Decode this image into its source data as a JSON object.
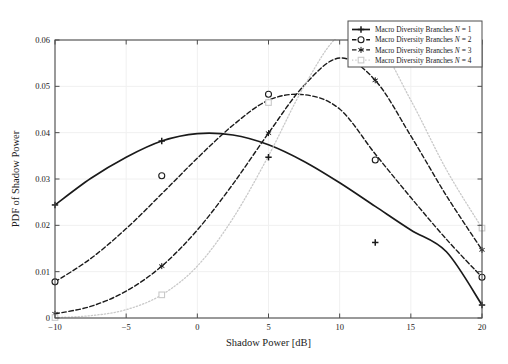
{
  "chart_data": {
    "type": "line",
    "title": "",
    "xlabel": "Shadow Power [dB]",
    "ylabel": "PDF of Shadow Power",
    "xlim": [
      -10,
      20
    ],
    "ylim": [
      0,
      0.06
    ],
    "xticks": [
      -10,
      -5,
      0,
      5,
      10,
      15,
      20
    ],
    "xtick_labels": [
      "−10",
      "−5",
      "0",
      "5",
      "10",
      "15",
      "20"
    ],
    "yticks": [
      0,
      0.01,
      0.02,
      0.03,
      0.04,
      0.05,
      0.06
    ],
    "ytick_labels": [
      "0",
      "0.01",
      "0.02",
      "0.03",
      "0.04",
      "0.05",
      "0.06"
    ],
    "grid": true,
    "legend_position": "top-right",
    "series": [
      {
        "name": "Macro Diversity Branches N = 1",
        "label_prefix": "Macro Diversity Branches ",
        "label_var": "N",
        "label_suffix": " = 1",
        "n": 1,
        "linestyle": "solid",
        "marker": "plus-filled",
        "color": "#1a1a1a",
        "width": 1.7,
        "mu": 0.6,
        "sigma": 10.0,
        "peak_x": 0.6,
        "peak_y": 0.0399,
        "x": [
          -10,
          -7.5,
          -5,
          -2.5,
          0,
          2.5,
          5,
          7.5,
          10,
          12.5,
          15,
          17.5,
          20
        ],
        "y": [
          0.0244,
          0.0301,
          0.0347,
          0.0382,
          0.0398,
          0.0395,
          0.0374,
          0.0338,
          0.0292,
          0.0241,
          0.019,
          0.0143,
          0.0028
        ],
        "markers_x": [
          -10,
          -2.5,
          5,
          12.5,
          20
        ],
        "markers_y": [
          0.0244,
          0.0382,
          0.0347,
          0.0163,
          0.0028
        ]
      },
      {
        "name": "Macro Diversity Branches N = 2",
        "label_prefix": "Macro Diversity Branches ",
        "label_var": "N",
        "label_suffix": " = 2",
        "n": 2,
        "linestyle": "dashed",
        "marker": "circle",
        "color": "#1a1a1a",
        "width": 1.4,
        "peak_x": 5.2,
        "peak_y": 0.0484,
        "x": [
          -10,
          -7.5,
          -5,
          -2.5,
          0,
          2.5,
          5,
          7.5,
          10,
          12.5,
          15,
          17.5,
          20
        ],
        "y": [
          0.0078,
          0.0128,
          0.0193,
          0.0268,
          0.0345,
          0.0416,
          0.047,
          0.0482,
          0.0451,
          0.0354,
          0.026,
          0.017,
          0.0088
        ],
        "markers_x": [
          -10,
          -2.5,
          5,
          12.5,
          20
        ],
        "markers_y": [
          0.0078,
          0.0307,
          0.0483,
          0.0341,
          0.0088
        ]
      },
      {
        "name": "Macro Diversity Branches N = 3",
        "label_prefix": "Macro Diversity Branches ",
        "label_var": "N",
        "label_suffix": " = 3",
        "n": 3,
        "linestyle": "dashed",
        "marker": "asterisk",
        "color": "#1a1a1a",
        "width": 1.4,
        "peak_x": 7.6,
        "peak_y": 0.0567,
        "x": [
          -10,
          -7.5,
          -5,
          -2.5,
          0,
          2.5,
          5,
          7.5,
          10,
          12.5,
          15,
          17.5,
          20
        ],
        "y": [
          0.0009,
          0.0025,
          0.0058,
          0.0112,
          0.019,
          0.0289,
          0.0399,
          0.0502,
          0.0561,
          0.0513,
          0.0393,
          0.0264,
          0.0147
        ],
        "markers_x": [
          -10,
          -2.5,
          5,
          12.5,
          20
        ],
        "markers_y": [
          0.0009,
          0.0112,
          0.0399,
          0.0513,
          0.0147
        ]
      },
      {
        "name": "Macro Diversity Branches N = 4",
        "label_prefix": "Macro Diversity Branches ",
        "label_var": "N",
        "label_suffix": " = 4",
        "n": 4,
        "linestyle": "dotted",
        "marker": "square",
        "color": "#c9c9c9",
        "width": 1.3,
        "peak_x": 8.6,
        "peak_y": 0.0615,
        "x": [
          -10,
          -7.5,
          -5,
          -2.5,
          0,
          2.5,
          5,
          7.5,
          10,
          12.5,
          15,
          17.5,
          20
        ],
        "y": [
          0.0001,
          0.0005,
          0.0018,
          0.005,
          0.0112,
          0.0215,
          0.035,
          0.05,
          0.061,
          0.06,
          0.047,
          0.032,
          0.0194
        ],
        "markers_x": [
          -10,
          -2.5,
          5,
          12.5,
          20
        ],
        "markers_y": [
          0.0001,
          0.005,
          0.0465,
          0.06,
          0.0194
        ]
      }
    ]
  },
  "legend": {
    "entries": [
      "Macro Diversity Branches N = 1",
      "Macro Diversity Branches N = 2",
      "Macro Diversity Branches N = 3",
      "Macro Diversity Branches N = 4"
    ]
  },
  "colors": {
    "axis": "#4d4d4d",
    "grid": "#f0f0f0",
    "curve_dark": "#1a1a1a",
    "curve_light": "#c9c9c9",
    "background": "#ffffff"
  }
}
